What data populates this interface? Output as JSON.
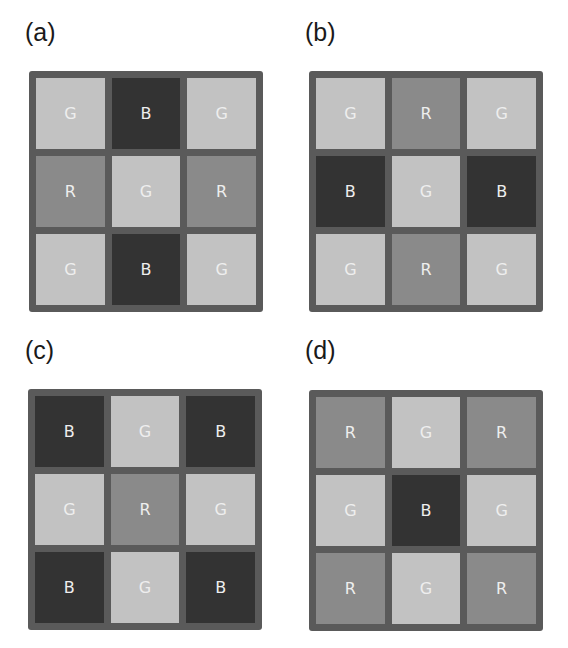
{
  "colors": {
    "frame": "#5a5a5a",
    "G": "#c2c2c2",
    "R": "#8a8a8a",
    "B": "#333333",
    "label_text": "#eeeeee"
  },
  "panels": [
    {
      "label": "(a)",
      "cells": [
        "G",
        "B",
        "G",
        "R",
        "G",
        "R",
        "G",
        "B",
        "G"
      ]
    },
    {
      "label": "(b)",
      "cells": [
        "G",
        "R",
        "G",
        "B",
        "G",
        "B",
        "G",
        "R",
        "G"
      ]
    },
    {
      "label": "(c)",
      "cells": [
        "B",
        "G",
        "B",
        "G",
        "R",
        "G",
        "B",
        "G",
        "B"
      ]
    },
    {
      "label": "(d)",
      "cells": [
        "R",
        "G",
        "R",
        "G",
        "B",
        "G",
        "R",
        "G",
        "R"
      ]
    }
  ]
}
